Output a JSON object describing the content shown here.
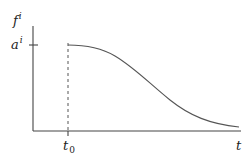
{
  "diagram": {
    "y_axis_label": {
      "base": "f",
      "sup": "i"
    },
    "y_tick_label": {
      "base": "a",
      "sup": "i"
    },
    "x_tick_label": {
      "base": "t",
      "sub": "0"
    },
    "x_axis_label": "t",
    "curve_description": "Decreasing curve starting at level a^i at time t0, flat briefly then smoothly declining toward zero as t increases",
    "line_color": "#555555",
    "axis_color": "#444444"
  }
}
